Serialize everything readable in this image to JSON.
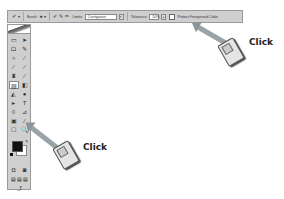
{
  "options_bar": {
    "tool_icon": "eraser-tool-icon",
    "tool_dropdown": "▾",
    "brush_label": "Brush:",
    "brush_size": "13",
    "brush_dropdown": "▾",
    "mode_icons": [
      "erase-once-icon",
      "erase-contiguous-icon",
      "sample-background-icon"
    ],
    "limits_label": "Limits:",
    "limits_value": "Contiguous",
    "tolerance_label": "Tolerance:",
    "tolerance_value": "50%",
    "protect_label": "Protect Foreground Color",
    "protect_checked": false
  },
  "toolbox": {
    "tools": [
      "▭",
      "➤",
      "ᗝ",
      "✎",
      "⌗",
      "∕",
      "∕",
      "∕",
      "♜",
      "∕",
      "▨",
      "◧",
      "◭",
      "●",
      "▸",
      "T",
      "◊",
      "⊿",
      "▣",
      "∕",
      "☐",
      "🔍"
    ],
    "bottom_icons": [
      "◘",
      "◙",
      "▤",
      "▤",
      "▤",
      "⤴"
    ]
  },
  "callouts": [
    {
      "label": "Click"
    },
    {
      "label": "Click"
    }
  ]
}
